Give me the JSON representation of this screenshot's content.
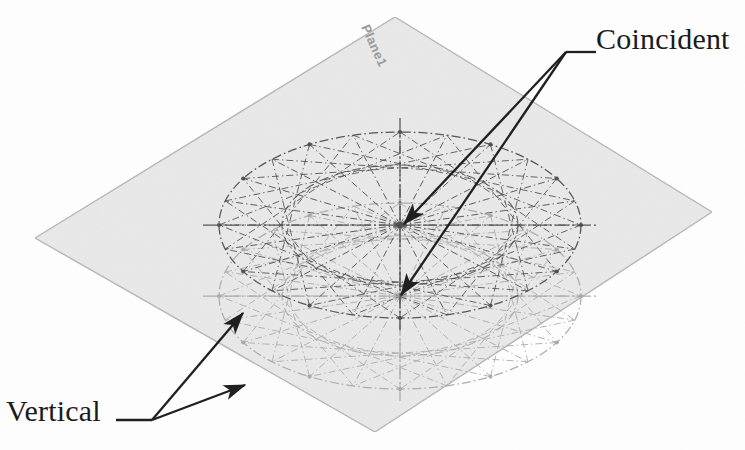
{
  "labels": {
    "coincident": "Coincident",
    "vertical": "Vertical",
    "plane": "Plane1"
  },
  "colors": {
    "plane_fill": "#e9e9e9",
    "plane_edge": "#b5b5b5",
    "construction_upper": "#4a4a4a",
    "construction_lower": "#a8a8a8",
    "arrow": "#1b1b1b",
    "text": "#1b1b1b",
    "plane_label": "#9a9a9a"
  },
  "geometry": {
    "plane": {
      "top": [
        395,
        17
      ],
      "right": [
        712,
        212
      ],
      "bottom": [
        375,
        432
      ],
      "left": [
        35,
        238
      ]
    },
    "upper_ellipse": {
      "cx": 400,
      "cy": 225,
      "rx": 181,
      "ry": 93,
      "inner_rx": 118,
      "inner_ry": 60,
      "spokes": 24,
      "chord_step": 7,
      "style": "dash-dot"
    },
    "lower_ellipse": {
      "cx": 400,
      "cy": 296,
      "rx": 181,
      "ry": 93,
      "inner_rx": 118,
      "inner_ry": 60,
      "spokes": 24,
      "chord_step": 7,
      "style": "dash-dot"
    }
  },
  "annotations": [
    {
      "id": "coincident",
      "label": "Coincident",
      "leader_elbow": [
        566,
        52
      ],
      "leader_tail": [
        596,
        52
      ],
      "targets": [
        [
          404,
          224
        ],
        [
          401,
          295
        ]
      ],
      "target_names": [
        "upper-ellipse-center",
        "lower-ellipse-center"
      ]
    },
    {
      "id": "vertical",
      "label": "Vertical",
      "leader_elbow": [
        152,
        420
      ],
      "leader_tail": [
        116,
        420
      ],
      "targets": [
        [
          243,
          313
        ],
        [
          245,
          385
        ]
      ],
      "target_names": [
        "upper-ellipse-rim-point",
        "lower-ellipse-rim-point"
      ]
    }
  ]
}
